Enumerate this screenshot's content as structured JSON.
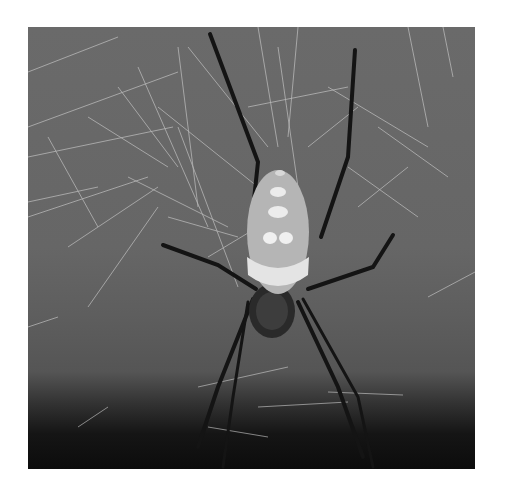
{
  "image": {
    "subject": "Spider on web",
    "description": "Grayscale photograph of a large orb-weaver spider centered on its web against a dark gradient background",
    "colors": {
      "background_top": "#6a6a6a",
      "background_bottom": "#0c0c0c",
      "web_strand": "#cfcfcf",
      "spider_legs": "#151515",
      "abdomen": "#b8b8b8",
      "abdomen_band": "#e6e6e6"
    }
  }
}
